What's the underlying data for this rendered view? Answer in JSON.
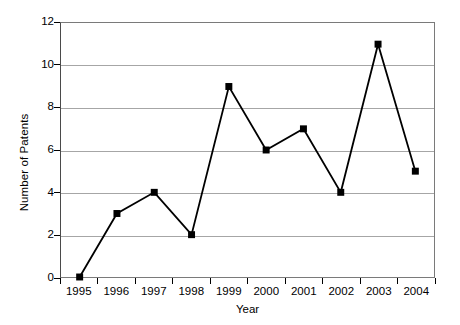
{
  "chart_data": {
    "type": "line",
    "title": "",
    "subtitle": "",
    "xlabel": "Year",
    "ylabel": "Number of Patents",
    "categories": [
      "1995",
      "1996",
      "1997",
      "1998",
      "1999",
      "2000",
      "2001",
      "2002",
      "2003",
      "2004"
    ],
    "values": [
      0,
      3,
      4,
      2,
      9,
      6,
      7,
      4,
      11,
      5
    ],
    "series": [
      {
        "name": "Number of Patents",
        "values": [
          0,
          3,
          4,
          2,
          9,
          6,
          7,
          4,
          11,
          5
        ]
      }
    ],
    "ylim": [
      0,
      12
    ],
    "yticks": [
      0,
      2,
      4,
      6,
      8,
      10,
      12
    ],
    "ytick_labels": [
      "0",
      "2",
      "4",
      "6",
      "8",
      "10",
      "12"
    ],
    "grid": "horizontal",
    "legend": "none",
    "marker": "square",
    "line_color": "#000000",
    "marker_color": "#000000",
    "grid_color": "#a6a6a6",
    "frame_color": "#7a7a7a",
    "background_color": "#ffffff",
    "annotations": []
  }
}
